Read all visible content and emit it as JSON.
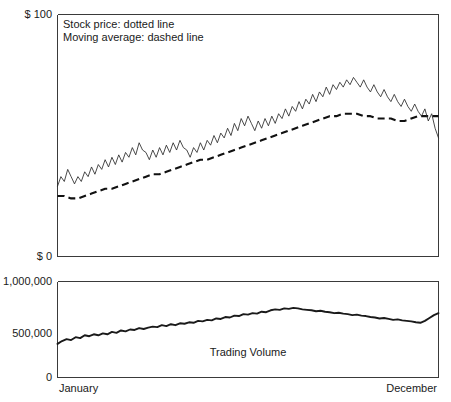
{
  "chart_data": {
    "type": "line",
    "title": "",
    "subtitle": "",
    "xlabel": "",
    "ylabel": "",
    "grid": false,
    "legend_position": "top-left-inside",
    "panels": [
      {
        "name": "price-panel",
        "ylabel": "",
        "ylim": [
          0,
          100
        ],
        "ytick_labels": [
          "$ 100",
          "$ 0"
        ],
        "ytick_values": [
          100,
          0
        ],
        "annotations": [
          "Stock price: dotted line",
          "Moving average: dashed line"
        ],
        "series": [
          {
            "name": "Stock price",
            "style": "dotted",
            "x": [
              0,
              1,
              2,
              3,
              4,
              5,
              6,
              7,
              8,
              9,
              10,
              11,
              12,
              13,
              14,
              15,
              16,
              17,
              18,
              19,
              20,
              21,
              22,
              23,
              24,
              25,
              26,
              27,
              28,
              29,
              30,
              31,
              32,
              33,
              34,
              35,
              36,
              37,
              38,
              39,
              40,
              41,
              42,
              43,
              44,
              45,
              46,
              47,
              48,
              49,
              50,
              51,
              52,
              53,
              54,
              55,
              56,
              57,
              58,
              59,
              60,
              61,
              62,
              63,
              64,
              65,
              66,
              67,
              68,
              69,
              70,
              71,
              72,
              73,
              74,
              75,
              76,
              77,
              78,
              79,
              80,
              81,
              82,
              83,
              84,
              85,
              86,
              87,
              88,
              89,
              90,
              91,
              92,
              93,
              94,
              95,
              96,
              97,
              98,
              99,
              100,
              101,
              102,
              103,
              104,
              105,
              106,
              107,
              108,
              109,
              110,
              111,
              112
            ],
            "values": [
              29,
              33,
              31,
              36,
              33,
              30,
              33,
              31,
              35,
              33,
              37,
              34,
              38,
              36,
              40,
              37,
              41,
              38,
              42,
              39,
              43,
              41,
              45,
              42,
              47,
              44,
              43,
              40,
              44,
              41,
              45,
              42,
              46,
              43,
              47,
              44,
              48,
              45,
              44,
              41,
              45,
              43,
              47,
              44,
              48,
              46,
              50,
              47,
              51,
              49,
              53,
              50,
              55,
              52,
              57,
              54,
              58,
              55,
              52,
              56,
              53,
              57,
              54,
              58,
              55,
              59,
              57,
              61,
              58,
              62,
              60,
              64,
              61,
              65,
              63,
              67,
              64,
              68,
              66,
              70,
              67,
              71,
              69,
              72,
              70,
              73,
              71,
              74,
              72,
              70,
              73,
              70,
              68,
              71,
              68,
              66,
              69,
              66,
              64,
              67,
              64,
              62,
              65,
              62,
              60,
              63,
              60,
              58,
              61,
              56,
              59,
              53,
              49
            ],
            "description": "Thin jagged oscillating line rising from ~29 at January to a peak near 74 around late September, then declining to ~49 at December"
          },
          {
            "name": "Moving average",
            "style": "dashed",
            "x": [
              0,
              1,
              2,
              3,
              4,
              5,
              6,
              7,
              8,
              9,
              10,
              11,
              12,
              13,
              14,
              15,
              16,
              17,
              18,
              19,
              20,
              21,
              22,
              23,
              24,
              25,
              26,
              27,
              28,
              29,
              30,
              31,
              32,
              33,
              34,
              35,
              36,
              37,
              38,
              39,
              40,
              41,
              42,
              43,
              44,
              45,
              46,
              47,
              48,
              49,
              50,
              51,
              52,
              53,
              54,
              55,
              56
            ],
            "values": [
              25,
              25,
              24,
              24,
              25,
              26,
              27,
              28,
              28,
              29,
              30,
              31,
              32,
              33,
              34,
              34,
              35,
              36,
              37,
              38,
              39,
              40,
              40,
              41,
              42,
              43,
              44,
              45,
              46,
              47,
              48,
              49,
              50,
              51,
              52,
              53,
              54,
              55,
              56,
              57,
              58,
              58,
              59,
              59,
              59,
              58,
              58,
              57,
              57,
              57,
              56,
              56,
              57,
              58,
              58,
              58,
              58
            ],
            "description": "Bold dashed line rising smoothly from ~25 in January, peaking around 59 in autumn, flattening near 58 through December"
          }
        ]
      },
      {
        "name": "volume-panel",
        "ylabel": "",
        "ylim": [
          0,
          1000000
        ],
        "ytick_labels": [
          "1,000,000",
          "500,000",
          "0"
        ],
        "ytick_values": [
          1000000,
          500000,
          0
        ],
        "annotations": [
          "Trading Volume"
        ],
        "series": [
          {
            "name": "Trading Volume",
            "style": "solid",
            "x": [
              0,
              1,
              2,
              3,
              4,
              5,
              6,
              7,
              8,
              9,
              10,
              11,
              12,
              13,
              14,
              15,
              16,
              17,
              18,
              19,
              20,
              21,
              22,
              23,
              24,
              25,
              26,
              27,
              28,
              29,
              30,
              31,
              32,
              33,
              34,
              35,
              36,
              37,
              38,
              39,
              40,
              41,
              42,
              43,
              44,
              45,
              46,
              47,
              48,
              49,
              50,
              51,
              52,
              53,
              54,
              55,
              56,
              57,
              58,
              59,
              60,
              61,
              62,
              63,
              64,
              65,
              66,
              67,
              68,
              69,
              70,
              71,
              72,
              73,
              74,
              75,
              76,
              77,
              78,
              79,
              80,
              81,
              82,
              83,
              84
            ],
            "values": [
              350000,
              380000,
              400000,
              390000,
              420000,
              410000,
              440000,
              430000,
              450000,
              440000,
              460000,
              450000,
              475000,
              465000,
              490000,
              480000,
              500000,
              495000,
              515000,
              505000,
              520000,
              530000,
              525000,
              545000,
              535000,
              555000,
              545000,
              565000,
              560000,
              575000,
              570000,
              590000,
              585000,
              600000,
              595000,
              615000,
              610000,
              630000,
              625000,
              645000,
              640000,
              660000,
              655000,
              670000,
              665000,
              685000,
              680000,
              700000,
              710000,
              705000,
              720000,
              715000,
              725000,
              720000,
              710000,
              705000,
              700000,
              690000,
              695000,
              685000,
              680000,
              670000,
              675000,
              665000,
              660000,
              650000,
              655000,
              645000,
              640000,
              630000,
              625000,
              615000,
              620000,
              610000,
              600000,
              605000,
              595000,
              590000,
              585000,
              575000,
              570000,
              590000,
              620000,
              650000,
              670000
            ],
            "description": "Bold solid line rising from ~350,000 in January to a peak near 725,000 in late summer, declining to ~570,000 in November, then rising sharply to ~670,000 at December"
          }
        ]
      }
    ],
    "xtick_labels": [
      "January",
      "December"
    ],
    "x_range_label_left": "January",
    "x_range_label_right": "December"
  },
  "legend": {
    "line1": "Stock price: dotted line",
    "line2": "Moving average: dashed line"
  },
  "axis_labels": {
    "price_top": "$ 100",
    "price_bottom": "$ 0",
    "volume_top": "1,000,000",
    "volume_mid": "500,000",
    "volume_bottom": "0"
  },
  "annotations": {
    "volume_series": "Trading Volume"
  },
  "months": {
    "start": "January",
    "end": "December"
  },
  "colors": {
    "line": "#1a1a1a",
    "axis": "#3a3a3a",
    "background": "#ffffff"
  }
}
